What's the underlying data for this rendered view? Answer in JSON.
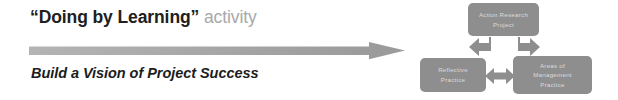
{
  "slide": {
    "background_color": "#ffffff"
  },
  "left_panel": {
    "headline": {
      "quoted_text": "“Doing by Learning”",
      "trailing_text": " activity",
      "quoted_color": "#202020",
      "trailing_color": "#a8a8a8"
    },
    "subheadline": {
      "text": "Build a Vision of Project Success",
      "color": "#1c1c1c"
    },
    "progress_arrow": {
      "direction": "right",
      "color_start": "#b0b0b0",
      "color_end": "#9a9a9a"
    }
  },
  "diagram": {
    "node_fill": "#8e8e8e",
    "node_text_color": "#dcdcdc",
    "connector_color": "#8e8e8e",
    "nodes": [
      {
        "id": "action-research-project",
        "lines": [
          "Action Research",
          "Project"
        ],
        "position": "top"
      },
      {
        "id": "reflective-practice",
        "lines": [
          "Reflective",
          "Practice"
        ],
        "position": "bottom-left"
      },
      {
        "id": "areas-of-management-practice",
        "lines": [
          "Areas of",
          "Management",
          "Practice"
        ],
        "position": "bottom-right"
      }
    ],
    "connectors": [
      {
        "id": "top-to-left",
        "type": "bent-arrow",
        "direction": "down-left"
      },
      {
        "id": "top-to-right",
        "type": "bent-arrow",
        "direction": "down-right"
      },
      {
        "id": "left-to-right",
        "type": "double-arrow",
        "direction": "horizontal"
      }
    ]
  }
}
